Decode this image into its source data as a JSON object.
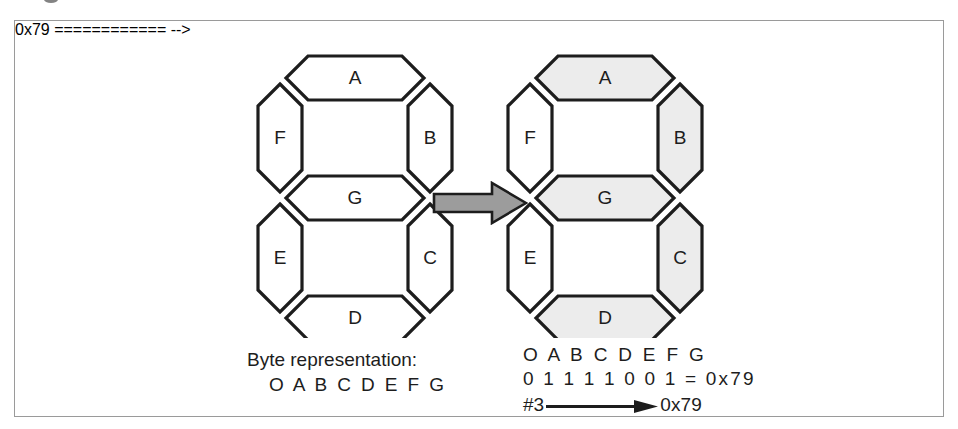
{
  "figure": {
    "caption_remnant": "",
    "frame_color": "#9a9a9a"
  },
  "colors": {
    "segment_on_fill": "#ececec",
    "segment_off_fill": "#ffffff",
    "outline": "#1d1d1d",
    "arrow_fill": "#9c9c9c",
    "text": "#1d1d1d"
  },
  "displays": [
    {
      "id": "display-off",
      "name": "blank-seven-segment-display",
      "state_label": "all segments off",
      "segments": [
        {
          "id": "A",
          "label": "A",
          "on": false
        },
        {
          "id": "B",
          "label": "B",
          "on": false
        },
        {
          "id": "C",
          "label": "C",
          "on": false
        },
        {
          "id": "D",
          "label": "D",
          "on": false
        },
        {
          "id": "E",
          "label": "E",
          "on": false
        },
        {
          "id": "F",
          "label": "F",
          "on": false
        },
        {
          "id": "G",
          "label": "G",
          "on": false
        }
      ]
    },
    {
      "id": "display-on",
      "name": "digit-three-seven-segment-display",
      "state_label": "digit 3 lit",
      "segments": [
        {
          "id": "A",
          "label": "A",
          "on": true
        },
        {
          "id": "B",
          "label": "B",
          "on": true
        },
        {
          "id": "C",
          "label": "C",
          "on": true
        },
        {
          "id": "D",
          "label": "D",
          "on": true
        },
        {
          "id": "E",
          "label": "E",
          "on": false
        },
        {
          "id": "F",
          "label": "F",
          "on": false
        },
        {
          "id": "G",
          "label": "G",
          "on": true
        }
      ]
    }
  ],
  "arrow": {
    "direction": "right",
    "label": ""
  },
  "left_text": {
    "caption": "Byte representation:",
    "bit_names": "O A B C D E F G"
  },
  "right_text": {
    "bit_names": "O A B C D E F G",
    "bit_values": "0 1 1 1 1 0 0 1 = 0x79",
    "bits": [
      "0",
      "1",
      "1",
      "1",
      "1",
      "0",
      "0",
      "1"
    ],
    "equals": "=",
    "hex_value": "0x79",
    "digit_index": "#3",
    "result_hex": "0x79"
  }
}
